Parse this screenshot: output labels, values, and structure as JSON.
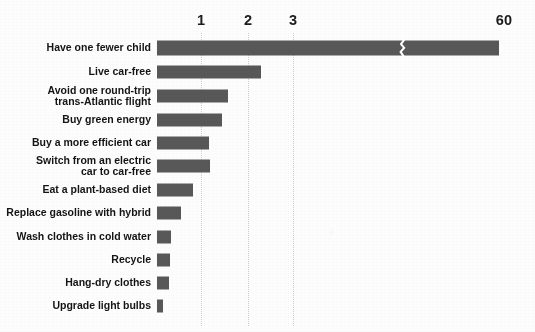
{
  "chart_data": {
    "type": "bar",
    "orientation": "horizontal",
    "title": "",
    "xlabel": "",
    "ylabel": "",
    "categories": [
      "Have one fewer child",
      "Live car-free",
      "Avoid one round-trip\ntrans-Atlantic flight",
      "Buy green energy",
      "Buy a more efficient car",
      "Switch from an electric\ncar to car-free",
      "Eat a plant-based diet",
      "Replace gasoline with hybrid",
      "Wash clothes in cold water",
      "Recycle",
      "Hang-dry clothes",
      "Upgrade light bulbs"
    ],
    "values": [
      60,
      2.4,
      1.6,
      1.5,
      1.19,
      1.15,
      0.8,
      0.52,
      0.25,
      0.21,
      0.21,
      0.1
    ],
    "tick_labels": [
      "1",
      "2",
      "3",
      "60"
    ],
    "tick_values": [
      1,
      2,
      3,
      60
    ],
    "xlim": [
      0,
      3.5
    ],
    "axis_break": {
      "present": true,
      "after_value": 3.1,
      "note": "zigzag break on top bar; scale jumps to 60"
    },
    "grid": "vertical-dotted",
    "legend": "none",
    "bar_color": "#585858",
    "background_color": "#fdfdfd",
    "units": "tonnes CO2-equivalent reduced per year"
  },
  "axis": {
    "ticks": [
      {
        "label": "1",
        "x": 201
      },
      {
        "label": "2",
        "x": 248
      },
      {
        "label": "3",
        "x": 293
      },
      {
        "label": "60",
        "x": 504
      }
    ]
  },
  "rows": [
    {
      "label": "Have one fewer child",
      "value": 60,
      "bar_px": 342,
      "top": 38,
      "height": 20,
      "tall": true,
      "break_px": 245
    },
    {
      "label": "Live car-free",
      "value": 2.4,
      "bar_px": 104,
      "top": 62,
      "height": 20,
      "tall": false,
      "break_px": null
    },
    {
      "label": "Avoid one round-trip\ntrans-Atlantic flight",
      "value": 1.6,
      "bar_px": 71,
      "top": 85,
      "height": 22,
      "tall": false,
      "break_px": null
    },
    {
      "label": "Buy green energy",
      "value": 1.5,
      "bar_px": 65,
      "top": 110,
      "height": 20,
      "tall": false,
      "break_px": null
    },
    {
      "label": "Buy a more efficient car",
      "value": 1.19,
      "bar_px": 52,
      "top": 133,
      "height": 20,
      "tall": false,
      "break_px": null
    },
    {
      "label": "Switch from an electric\ncar to car-free",
      "value": 1.15,
      "bar_px": 53,
      "top": 155,
      "height": 22,
      "tall": false,
      "break_px": null
    },
    {
      "label": "Eat a plant-based diet",
      "value": 0.8,
      "bar_px": 36,
      "top": 180,
      "height": 20,
      "tall": false,
      "break_px": null
    },
    {
      "label": "Replace gasoline with hybrid",
      "value": 0.52,
      "bar_px": 24,
      "top": 203,
      "height": 20,
      "tall": false,
      "break_px": null
    },
    {
      "label": "Wash clothes in cold water",
      "value": 0.25,
      "bar_px": 14,
      "top": 227,
      "height": 20,
      "tall": false,
      "break_px": null
    },
    {
      "label": "Recycle",
      "value": 0.21,
      "bar_px": 13,
      "top": 250,
      "height": 20,
      "tall": false,
      "break_px": null
    },
    {
      "label": "Hang-dry clothes",
      "value": 0.21,
      "bar_px": 12,
      "top": 273,
      "height": 20,
      "tall": false,
      "break_px": null
    },
    {
      "label": "Upgrade light bulbs",
      "value": 0.1,
      "bar_px": 6,
      "top": 296,
      "height": 20,
      "tall": false,
      "break_px": null
    }
  ]
}
